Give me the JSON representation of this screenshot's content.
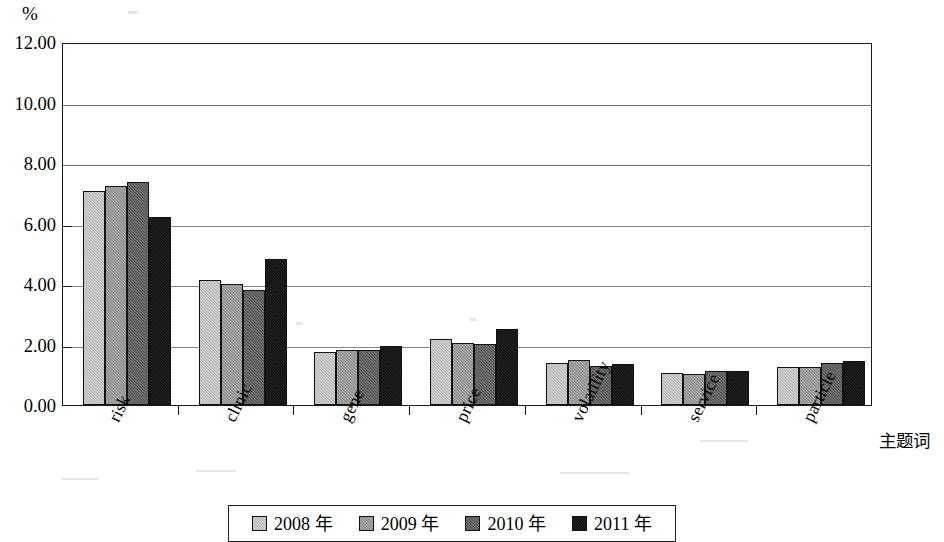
{
  "chart_data": {
    "type": "bar",
    "title": "",
    "subtitle": "",
    "xlabel": "主题词",
    "ylabel": "%",
    "ylim": [
      0,
      12
    ],
    "ytick_step": 2,
    "ytick_labels": [
      "0.00",
      "2.00",
      "4.00",
      "6.00",
      "8.00",
      "10.00",
      "12.00"
    ],
    "grid": true,
    "legend_position": "bottom",
    "categories": [
      "risk",
      "clinic",
      "gene",
      "price",
      "volatility",
      "service",
      "particle"
    ],
    "series": [
      {
        "name": "2008 年",
        "color": "#d9d9d9",
        "values": [
          7.08,
          4.12,
          1.74,
          2.18,
          1.38,
          1.05,
          1.26
        ]
      },
      {
        "name": "2009 年",
        "color": "#b4b4b4",
        "values": [
          7.25,
          4.0,
          1.82,
          2.05,
          1.48,
          1.02,
          1.27
        ]
      },
      {
        "name": "2010 年",
        "color": "#7e7e7e",
        "values": [
          7.38,
          3.8,
          1.82,
          2.02,
          1.28,
          1.13,
          1.4
        ]
      },
      {
        "name": "2011 年",
        "color": "#0d0d0d",
        "values": [
          6.22,
          4.83,
          1.95,
          2.51,
          1.36,
          1.11,
          1.47
        ]
      }
    ]
  },
  "axis": {
    "y_unit_label": "%",
    "x_title": "主题词"
  },
  "legend": {
    "items": [
      {
        "label": "2008 年",
        "swatch": "legend-swatch-2008"
      },
      {
        "label": "2009 年",
        "swatch": "legend-swatch-2009"
      },
      {
        "label": "2010 年",
        "swatch": "legend-swatch-2010"
      },
      {
        "label": "2011 年",
        "swatch": "legend-swatch-2011"
      }
    ]
  }
}
